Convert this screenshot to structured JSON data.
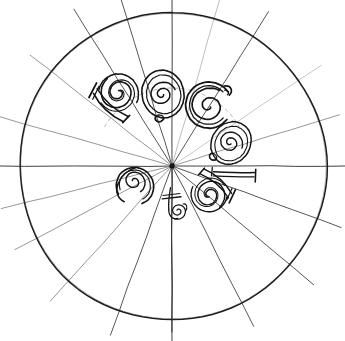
{
  "figure": {
    "title": "Radial spiral-letter construction diagram",
    "type": "line-art-diagram",
    "medium": "hand-drawn scanned ink line drawing",
    "background_color": "#ffffff",
    "ink_color": "#1a1a1a",
    "faint_ink_color": "#6e6e6e",
    "canvas": {
      "width": 345,
      "height": 341
    }
  },
  "circle": {
    "name": "outer-circle",
    "center_x": 172.5,
    "center_y": 166.5,
    "radius": 153.5,
    "stroke": "#1a1a1a",
    "stroke_width": 1.5,
    "fill": "none",
    "left_edge_x": 19,
    "right_edge_x": 326,
    "top_edge_y": 13,
    "bottom_edge_y": 320
  },
  "convergence_point": {
    "name": "radial-origin",
    "x": 172,
    "y": 166,
    "marker": "ink-blot-dot",
    "radius": 2.6
  },
  "radial_lines": [
    {
      "id": "spoke-vertical-up",
      "angle_deg": -90,
      "inner": -166,
      "outer": 170,
      "weight": 0.9,
      "tone": "dark"
    },
    {
      "id": "spoke-vertical-down",
      "angle_deg": 90,
      "inner": 0,
      "outer": 175,
      "weight": 0.9,
      "tone": "dark"
    },
    {
      "id": "spoke-horizontal-left",
      "angle_deg": 180,
      "inner": 0,
      "outer": 172,
      "weight": 0.9,
      "tone": "dark"
    },
    {
      "id": "spoke-horizontal-right",
      "angle_deg": 0,
      "inner": 0,
      "outer": 173,
      "weight": 0.9,
      "tone": "dark"
    },
    {
      "id": "spoke-nnw",
      "angle_deg": -107,
      "inner": 0,
      "outer": 180,
      "weight": 0.8,
      "tone": "dark"
    },
    {
      "id": "spoke-nw",
      "angle_deg": -122,
      "inner": 0,
      "outer": 185,
      "weight": 0.8,
      "tone": "dark"
    },
    {
      "id": "spoke-wnw",
      "angle_deg": -142,
      "inner": 0,
      "outer": 180,
      "weight": 0.7,
      "tone": "mid"
    },
    {
      "id": "spoke-w-high",
      "angle_deg": -164,
      "inner": 0,
      "outer": 180,
      "weight": 0.7,
      "tone": "mid"
    },
    {
      "id": "spoke-nne",
      "angle_deg": -74,
      "inner": 0,
      "outer": 180,
      "weight": 0.7,
      "tone": "faint"
    },
    {
      "id": "spoke-ne",
      "angle_deg": -58,
      "inner": 0,
      "outer": 182,
      "weight": 0.8,
      "tone": "dark"
    },
    {
      "id": "spoke-ene",
      "angle_deg": -34,
      "inner": 0,
      "outer": 180,
      "weight": 0.6,
      "tone": "faint"
    },
    {
      "id": "spoke-e-high",
      "angle_deg": -17,
      "inner": 0,
      "outer": 175,
      "weight": 0.7,
      "tone": "mid"
    },
    {
      "id": "spoke-ese",
      "angle_deg": 20,
      "inner": 0,
      "outer": 180,
      "weight": 0.8,
      "tone": "dark"
    },
    {
      "id": "spoke-se",
      "angle_deg": 40,
      "inner": 0,
      "outer": 185,
      "weight": 0.8,
      "tone": "dark"
    },
    {
      "id": "spoke-sse",
      "angle_deg": 63,
      "inner": 0,
      "outer": 180,
      "weight": 0.8,
      "tone": "dark"
    },
    {
      "id": "spoke-ssw",
      "angle_deg": 110,
      "inner": 0,
      "outer": 180,
      "weight": 0.8,
      "tone": "dark"
    },
    {
      "id": "spoke-sw",
      "angle_deg": 132,
      "inner": 0,
      "outer": 182,
      "weight": 0.7,
      "tone": "mid"
    },
    {
      "id": "spoke-wsw",
      "angle_deg": 152,
      "inner": 0,
      "outer": 178,
      "weight": 0.7,
      "tone": "mid"
    },
    {
      "id": "spoke-w-low",
      "angle_deg": 166,
      "inner": 0,
      "outer": 176,
      "weight": 0.7,
      "tone": "mid"
    }
  ],
  "glyphs": [
    {
      "id": "glyph-1",
      "label": "b",
      "description": "stem with spiral bowl, stem topped by serif bar",
      "center_x": 114,
      "center_y": 98,
      "rotation_deg": -52,
      "scale": 1.0,
      "kind": "stem-spiral"
    },
    {
      "id": "glyph-2",
      "label": "o",
      "description": "closed oval with inner spiral",
      "center_x": 163,
      "center_y": 94,
      "rotation_deg": -18,
      "scale": 1.0,
      "kind": "oval-spiral"
    },
    {
      "id": "glyph-3",
      "label": "G",
      "description": "open C-form with spiral terminal and top hook",
      "center_x": 209,
      "center_y": 104,
      "rotation_deg": 8,
      "scale": 1.05,
      "kind": "open-spiral"
    },
    {
      "id": "glyph-4",
      "label": "o",
      "description": "oval with inner spiral, tilted",
      "center_x": 231,
      "center_y": 143,
      "rotation_deg": 26,
      "scale": 0.92,
      "kind": "oval-spiral"
    },
    {
      "id": "glyph-5",
      "label": "1",
      "description": "long tapered stroke with terminal serif bar",
      "center_x": 234,
      "center_y": 173,
      "rotation_deg": 96,
      "scale": 0.85,
      "kind": "stem-bar"
    },
    {
      "id": "glyph-6",
      "label": "b",
      "description": "bowl with spiral, reversed",
      "center_x": 213,
      "center_y": 190,
      "rotation_deg": 126,
      "scale": 0.9,
      "kind": "stem-spiral"
    },
    {
      "id": "glyph-7",
      "label": "4",
      "description": "small spiral with crossed vertical stroke",
      "center_x": 176,
      "center_y": 207,
      "rotation_deg": 176,
      "scale": 0.82,
      "kind": "cross-spiral"
    },
    {
      "id": "glyph-8",
      "label": "a",
      "description": "round bowl with inward spiral, open top",
      "center_x": 135,
      "center_y": 186,
      "rotation_deg": -140,
      "scale": 0.95,
      "kind": "bowl-spiral"
    }
  ],
  "guide_arcs": [
    {
      "id": "guide-arc-upper",
      "description": "faint dashed arc through upper glyph row",
      "cx": 172,
      "cy": 166,
      "r": 78,
      "start_deg": -150,
      "end_deg": -30
    }
  ]
}
